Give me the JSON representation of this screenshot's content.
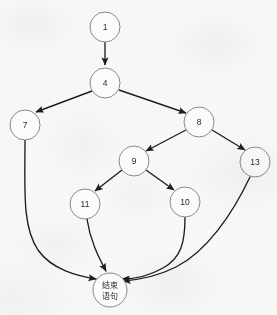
{
  "diagram": {
    "background_color": "#f7f7f5",
    "node_fill_color": "#fbfbf9",
    "node_stroke_color": "#8a8a88",
    "edge_color": "#1d1d1d",
    "nodes": [
      {
        "id": "1",
        "label": "1",
        "cx": 105,
        "cy": 27,
        "r": 15,
        "shape": "circle"
      },
      {
        "id": "4",
        "label": "4",
        "cx": 105,
        "cy": 83,
        "r": 15,
        "shape": "circle"
      },
      {
        "id": "7",
        "label": "7",
        "cx": 25,
        "cy": 125,
        "r": 15,
        "shape": "circle"
      },
      {
        "id": "8",
        "label": "8",
        "cx": 199,
        "cy": 122,
        "r": 15,
        "shape": "circle"
      },
      {
        "id": "9",
        "label": "9",
        "cx": 134,
        "cy": 161,
        "r": 15,
        "shape": "circle"
      },
      {
        "id": "13",
        "label": "13",
        "cx": 255,
        "cy": 162,
        "r": 15,
        "shape": "circle"
      },
      {
        "id": "11",
        "label": "11",
        "cx": 85,
        "cy": 204,
        "r": 15,
        "shape": "circle"
      },
      {
        "id": "10",
        "label": "10",
        "cx": 185,
        "cy": 202,
        "r": 15,
        "shape": "circle"
      },
      {
        "id": "end",
        "label_line1": "结束",
        "label_line2": "语句",
        "cx": 110,
        "cy": 290,
        "r": 17,
        "shape": "circle"
      }
    ],
    "edges": [
      {
        "from": "1",
        "to": "4",
        "style": "straight",
        "arrow": true
      },
      {
        "from": "4",
        "to": "7",
        "style": "straight",
        "arrow": true
      },
      {
        "from": "4",
        "to": "8",
        "style": "straight",
        "arrow": true
      },
      {
        "from": "8",
        "to": "9",
        "style": "straight",
        "arrow": true
      },
      {
        "from": "8",
        "to": "13",
        "style": "straight",
        "arrow": true
      },
      {
        "from": "9",
        "to": "11",
        "style": "straight",
        "arrow": true
      },
      {
        "from": "9",
        "to": "10",
        "style": "straight",
        "arrow": true
      },
      {
        "from": "7",
        "to": "end",
        "style": "curved",
        "arrow": true
      },
      {
        "from": "11",
        "to": "end",
        "style": "curved",
        "arrow": true
      },
      {
        "from": "10",
        "to": "end",
        "style": "curved",
        "arrow": true
      },
      {
        "from": "13",
        "to": "end",
        "style": "curved",
        "arrow": true
      }
    ]
  }
}
